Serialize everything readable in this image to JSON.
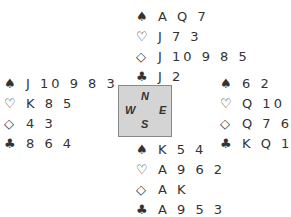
{
  "hands": {
    "north": {
      "spades": "A Q 7",
      "hearts": "J 7 3",
      "diamonds": "J 10 9 8 5",
      "clubs": "J 2"
    },
    "west": {
      "spades": "J 10 9 8 3",
      "hearts": "K 8 5",
      "diamonds": "4 3",
      "clubs": "8 6 4"
    },
    "east": {
      "spades": "6 2",
      "hearts": "Q 10 4",
      "diamonds": "Q 7 6 2",
      "clubs": "K Q 10 7"
    },
    "south": {
      "spades": "K 5 4",
      "hearts": "A 9 6 2",
      "diamonds": "A K",
      "clubs": "A 9 5 3"
    }
  },
  "suits": {
    "spades": "♠",
    "hearts": "♡",
    "diamonds": "◇",
    "clubs": "♣"
  },
  "compass": {
    "n": "N",
    "s": "S",
    "w": "W",
    "e": "E"
  }
}
